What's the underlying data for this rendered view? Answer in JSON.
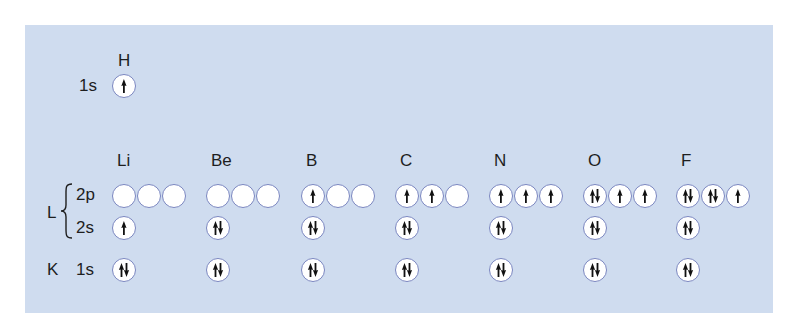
{
  "colors": {
    "panel_background": "#cfdcef",
    "orbital_border": "#7a86c0",
    "orbital_fill": "#ffffff",
    "arrow": "#111111"
  },
  "hydrogen": {
    "symbol": "H",
    "shell_label": "1s",
    "orbitals": {
      "1s": [
        "up"
      ]
    }
  },
  "row_labels": {
    "shell_L": "L",
    "shell_K": "K",
    "subshell_2p": "2p",
    "subshell_2s": "2s",
    "subshell_1s": "1s"
  },
  "elements": [
    {
      "symbol": "Li",
      "2p": [
        "empty",
        "empty",
        "empty"
      ],
      "2s": "up",
      "1s": "pair"
    },
    {
      "symbol": "Be",
      "2p": [
        "empty",
        "empty",
        "empty"
      ],
      "2s": "pair",
      "1s": "pair"
    },
    {
      "symbol": "B",
      "2p": [
        "up",
        "empty",
        "empty"
      ],
      "2s": "pair",
      "1s": "pair"
    },
    {
      "symbol": "C",
      "2p": [
        "up",
        "up",
        "empty"
      ],
      "2s": "pair",
      "1s": "pair"
    },
    {
      "symbol": "N",
      "2p": [
        "up",
        "up",
        "up"
      ],
      "2s": "pair",
      "1s": "pair"
    },
    {
      "symbol": "O",
      "2p": [
        "pair",
        "up",
        "up"
      ],
      "2s": "pair",
      "1s": "pair"
    },
    {
      "symbol": "F",
      "2p": [
        "pair",
        "pair",
        "up"
      ],
      "2s": "pair",
      "1s": "pair"
    }
  ]
}
